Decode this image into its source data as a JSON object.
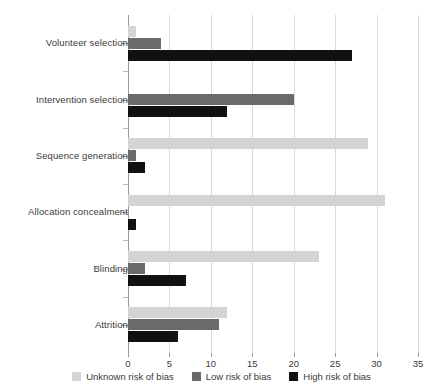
{
  "chart_data": {
    "type": "bar",
    "orientation": "horizontal",
    "title": "",
    "subtitle": "",
    "xlabel": "",
    "ylabel": "",
    "xlim": [
      0,
      35
    ],
    "ylim": null,
    "grid": true,
    "grid_axis": "x",
    "legend_position": "bottom",
    "categories": [
      "Volunteer selection",
      "Intervention selection",
      "Sequence generation",
      "Allocation concealment",
      "Blinding",
      "Attrition"
    ],
    "xticks": [
      0,
      5,
      10,
      15,
      20,
      25,
      30,
      35
    ],
    "xticklabels": [
      "0",
      "5",
      "10",
      "15",
      "20",
      "25",
      "30",
      "35"
    ],
    "series": [
      {
        "name": "Unknown risk of bias",
        "color": "#d4d4d4",
        "values": [
          1,
          0,
          29,
          31,
          23,
          12
        ]
      },
      {
        "name": "Low risk of bias",
        "color": "#6a6a6a",
        "values": [
          4,
          20,
          1,
          0,
          2,
          11
        ]
      },
      {
        "name": "High risk of bias",
        "color": "#111111",
        "values": [
          27,
          12,
          2,
          1,
          7,
          6
        ]
      }
    ]
  },
  "legend": {
    "items": [
      {
        "label": "Unknown risk of bias",
        "color": "#d4d4d4",
        "key": "unknown"
      },
      {
        "label": "Low risk of bias",
        "color": "#6a6a6a",
        "key": "low"
      },
      {
        "label": "High risk of bias",
        "color": "#111111",
        "key": "high"
      }
    ]
  },
  "axis": {
    "x_ticklabels": [
      "0",
      "5",
      "10",
      "15",
      "20",
      "25",
      "30",
      "35"
    ],
    "y_ticklabels": [
      "Volunteer selection",
      "Intervention selection",
      "Sequence generation",
      "Allocation concealment",
      "Blinding",
      "Attrition"
    ]
  },
  "colors": {
    "unknown": "#d4d4d4",
    "low": "#6a6a6a",
    "high": "#111111",
    "grid": "#d9d9d9",
    "axis": "#9a9a9a",
    "text": "#3a3a3a",
    "background": "#ffffff"
  }
}
